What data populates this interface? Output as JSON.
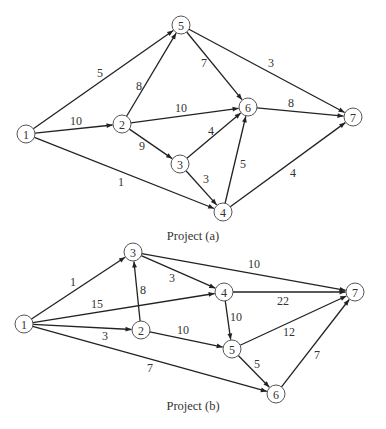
{
  "projects": [
    {
      "caption": "Project (a)",
      "caption_pos": [
        193,
        240
      ],
      "nodes": [
        {
          "id": "1",
          "x": 26,
          "y": 134
        },
        {
          "id": "2",
          "x": 122,
          "y": 124
        },
        {
          "id": "3",
          "x": 180,
          "y": 164
        },
        {
          "id": "4",
          "x": 223,
          "y": 212
        },
        {
          "id": "5",
          "x": 181,
          "y": 25
        },
        {
          "id": "6",
          "x": 248,
          "y": 107
        },
        {
          "id": "7",
          "x": 353,
          "y": 117
        }
      ],
      "edges": [
        {
          "from": "1",
          "to": "5",
          "weight": "5",
          "lx": 100,
          "ly": 73
        },
        {
          "from": "1",
          "to": "2",
          "weight": "10",
          "lx": 76,
          "ly": 121
        },
        {
          "from": "1",
          "to": "4",
          "weight": "1",
          "lx": 121,
          "ly": 182
        },
        {
          "from": "2",
          "to": "5",
          "weight": "8",
          "lx": 139,
          "ly": 86
        },
        {
          "from": "2",
          "to": "6",
          "weight": "10",
          "lx": 181,
          "ly": 108
        },
        {
          "from": "2",
          "to": "3",
          "weight": "9",
          "lx": 142,
          "ly": 146
        },
        {
          "from": "5",
          "to": "6",
          "weight": "7",
          "lx": 204,
          "ly": 63
        },
        {
          "from": "5",
          "to": "7",
          "weight": "3",
          "lx": 271,
          "ly": 63
        },
        {
          "from": "3",
          "to": "6",
          "weight": "4",
          "lx": 211,
          "ly": 131
        },
        {
          "from": "3",
          "to": "4",
          "weight": "3",
          "lx": 206,
          "ly": 179
        },
        {
          "from": "4",
          "to": "6",
          "weight": "5",
          "lx": 243,
          "ly": 164
        },
        {
          "from": "6",
          "to": "7",
          "weight": "8",
          "lx": 291,
          "ly": 103
        },
        {
          "from": "4",
          "to": "7",
          "weight": "4",
          "lx": 293,
          "ly": 173
        }
      ]
    },
    {
      "caption": "Project (b)",
      "caption_pos": [
        193,
        410
      ],
      "nodes": [
        {
          "id": "1",
          "x": 24,
          "y": 324
        },
        {
          "id": "2",
          "x": 141,
          "y": 330
        },
        {
          "id": "3",
          "x": 133,
          "y": 252
        },
        {
          "id": "4",
          "x": 224,
          "y": 292
        },
        {
          "id": "5",
          "x": 232,
          "y": 349
        },
        {
          "id": "6",
          "x": 276,
          "y": 394
        },
        {
          "id": "7",
          "x": 355,
          "y": 292
        }
      ],
      "edges": [
        {
          "from": "1",
          "to": "3",
          "weight": "1",
          "lx": 73,
          "ly": 282
        },
        {
          "from": "1",
          "to": "4",
          "weight": "15",
          "lx": 97,
          "ly": 304
        },
        {
          "from": "1",
          "to": "2",
          "weight": "3",
          "lx": 105,
          "ly": 336
        },
        {
          "from": "1",
          "to": "6",
          "weight": "7",
          "lx": 150,
          "ly": 368
        },
        {
          "from": "2",
          "to": "3",
          "weight": "8",
          "lx": 143,
          "ly": 290
        },
        {
          "from": "3",
          "to": "4",
          "weight": "3",
          "lx": 172,
          "ly": 278
        },
        {
          "from": "3",
          "to": "7",
          "weight": "10",
          "lx": 254,
          "ly": 264
        },
        {
          "from": "2",
          "to": "5",
          "weight": "10",
          "lx": 183,
          "ly": 330
        },
        {
          "from": "4",
          "to": "7",
          "weight": "22",
          "lx": 283,
          "ly": 301
        },
        {
          "from": "4",
          "to": "5",
          "weight": "10",
          "lx": 236,
          "ly": 317
        },
        {
          "from": "5",
          "to": "7",
          "weight": "12",
          "lx": 289,
          "ly": 332
        },
        {
          "from": "5",
          "to": "6",
          "weight": "5",
          "lx": 257,
          "ly": 364
        },
        {
          "from": "6",
          "to": "7",
          "weight": "7",
          "lx": 317,
          "ly": 355
        }
      ]
    }
  ],
  "style": {
    "node_radius": 9,
    "edge_color": "#222222",
    "node_stroke": "#555555",
    "text_color": "#333333"
  }
}
